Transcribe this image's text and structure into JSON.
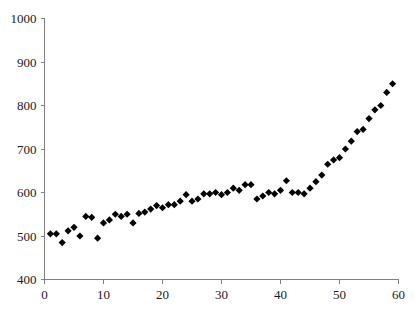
{
  "chart_data": {
    "type": "scatter",
    "title": "",
    "subtitle": "",
    "xlabel": "",
    "ylabel": "",
    "xlim": [
      0,
      60
    ],
    "ylim": [
      400,
      1000
    ],
    "xticks": [
      0,
      10,
      20,
      30,
      40,
      50,
      60
    ],
    "yticks": [
      400,
      500,
      600,
      700,
      800,
      900,
      1000
    ],
    "xtick_labels": [
      "0",
      "10",
      "20",
      "30",
      "40",
      "50",
      "60"
    ],
    "ytick_labels": [
      "400",
      "500",
      "600",
      "700",
      "800",
      "900",
      "1000"
    ],
    "grid": false,
    "legend": null,
    "marker": "diamond",
    "marker_color": "#000000",
    "marker_size": 4,
    "axis_color": "#808080",
    "series": [
      {
        "name": "series-1",
        "x": [
          1,
          2,
          3,
          4,
          5,
          6,
          7,
          8,
          9,
          10,
          11,
          12,
          13,
          14,
          15,
          16,
          17,
          18,
          19,
          20,
          21,
          22,
          23,
          24,
          25,
          26,
          27,
          28,
          29,
          30,
          31,
          32,
          33,
          34,
          35,
          36,
          37,
          38,
          39,
          40,
          41,
          42,
          43,
          44,
          45,
          46,
          47,
          48,
          49,
          50,
          51,
          52,
          53,
          54,
          55,
          56,
          57,
          58,
          59
        ],
        "y": [
          505,
          505,
          485,
          512,
          520,
          500,
          545,
          543,
          495,
          530,
          537,
          550,
          545,
          550,
          530,
          552,
          555,
          562,
          570,
          565,
          572,
          572,
          580,
          595,
          580,
          585,
          597,
          597,
          600,
          595,
          600,
          610,
          605,
          618,
          618,
          585,
          592,
          600,
          597,
          605,
          627,
          600,
          600,
          597,
          610,
          625,
          640,
          665,
          675,
          680,
          700,
          718,
          740,
          745,
          770,
          790,
          800,
          830,
          850
        ]
      }
    ]
  }
}
